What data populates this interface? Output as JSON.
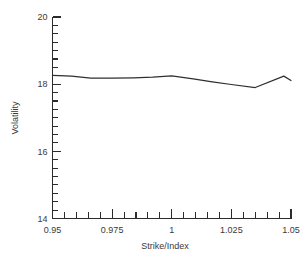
{
  "chart_data": {
    "type": "line",
    "title": "",
    "subtitle": "",
    "xlabel": "Strike/Index",
    "ylabel": "Volatility",
    "xlim": [
      0.95,
      1.05
    ],
    "ylim": [
      14,
      20
    ],
    "grid": false,
    "legend": null,
    "x_major_ticks": [
      0.95,
      0.975,
      1.0,
      1.025,
      1.05
    ],
    "x_major_tick_labels": [
      "0.95",
      "0.975",
      "1",
      "1.025",
      "1.05"
    ],
    "x_minor_tick_step": 0.005,
    "y_major_ticks": [
      14,
      16,
      18,
      20
    ],
    "y_major_tick_labels": [
      "14",
      "16",
      "18",
      "20"
    ],
    "y_minor_tick_step": 0.25,
    "series": [
      {
        "name": "Volatility smile",
        "color": "#2f2f2f",
        "x": [
          0.95,
          0.958,
          0.966,
          0.975,
          0.984,
          0.992,
          1.0,
          1.009,
          1.017,
          1.025,
          1.035,
          1.047,
          1.05
        ],
        "y": [
          18.26,
          18.24,
          18.18,
          18.18,
          18.19,
          18.21,
          18.25,
          18.16,
          18.07,
          17.99,
          17.9,
          18.24,
          18.11
        ]
      }
    ]
  },
  "axes": {
    "x_axis_title": "Strike/Index",
    "y_axis_title": "Volatility"
  },
  "colors": {
    "line": "#2f2f2f",
    "axis": "#2b2b2b",
    "text": "#3a3a3a",
    "background": "#ffffff"
  }
}
